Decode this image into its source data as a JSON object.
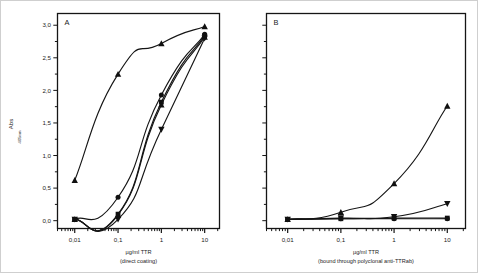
{
  "figure": {
    "background": "#ffffff",
    "line_color": "#151515",
    "marker_color": "#101010"
  },
  "yaxis": {
    "label_main": "Abs",
    "label_sub": "405nm",
    "ticks_major": [
      "0,0",
      "0,5",
      "1,0",
      "1,5",
      "2,0",
      "2,5",
      "3,0"
    ],
    "range": [
      -0.12,
      3.18
    ],
    "minor_step": 0.25
  },
  "panels": [
    {
      "id": "A",
      "label": "A",
      "xlabel_main": "µg/ml TTR",
      "xlabel_sub": "(direct coating)",
      "xticks": [
        "0,01",
        "0,1",
        "1",
        "10"
      ]
    },
    {
      "id": "B",
      "label": "B",
      "xlabel_main": "µg/ml TTR",
      "xlabel_sub": "(bound through polyclonal anti-TTRab)",
      "xticks": [
        "0,01",
        "0,1",
        "1",
        "10"
      ]
    }
  ],
  "chart_data": {
    "type": "line",
    "title": "",
    "ylabel": "Abs 405nm",
    "ylim": [
      0.0,
      3.0
    ],
    "yticks": [
      0.0,
      0.5,
      1.0,
      1.5,
      2.0,
      2.5,
      3.0
    ],
    "xlabel": "µg/ml TTR",
    "xscale": "log",
    "xlim": [
      0.004,
      22
    ],
    "xticks": [
      0.01,
      0.1,
      1,
      10
    ],
    "xticklabels": [
      "0,01",
      "0,1",
      "1",
      "10"
    ],
    "grid": false,
    "legend": "none",
    "panels": [
      {
        "panel": "A",
        "label": "A",
        "xlabel_sub": "(direct coating)",
        "x": [
          0.01,
          0.1,
          1,
          10
        ],
        "series": [
          {
            "name": "series-1-triangle-up",
            "marker": "triangle-up",
            "values": [
              0.62,
              2.25,
              2.72,
              2.98
            ]
          },
          {
            "name": "series-2-circle",
            "marker": "circle",
            "values": [
              0.02,
              0.36,
              1.93,
              2.86
            ]
          },
          {
            "name": "series-3-square",
            "marker": "square",
            "values": [
              0.02,
              0.1,
              1.82,
              2.84
            ]
          },
          {
            "name": "series-4-triangle-up-b",
            "marker": "triangle-up",
            "values": [
              0.02,
              0.09,
              1.78,
              2.82
            ]
          },
          {
            "name": "series-5-triangle-down",
            "marker": "triangle-down",
            "values": [
              0.02,
              0.02,
              1.4,
              2.8
            ]
          }
        ]
      },
      {
        "panel": "B",
        "label": "B",
        "xlabel_sub": "(bound through polyclonal anti-TTRab)",
        "x": [
          0.01,
          0.1,
          1,
          10
        ],
        "series": [
          {
            "name": "series-1-triangle-up",
            "marker": "triangle-up",
            "values": [
              0.02,
              0.13,
              0.57,
              1.76
            ]
          },
          {
            "name": "series-2-triangle-down",
            "marker": "triangle-down",
            "values": [
              0.02,
              0.04,
              0.06,
              0.26
            ]
          },
          {
            "name": "series-3-circle",
            "marker": "circle",
            "values": [
              0.02,
              0.03,
              0.03,
              0.03
            ]
          },
          {
            "name": "series-4-square",
            "marker": "square",
            "values": [
              0.02,
              0.03,
              0.04,
              0.04
            ]
          }
        ]
      }
    ]
  }
}
